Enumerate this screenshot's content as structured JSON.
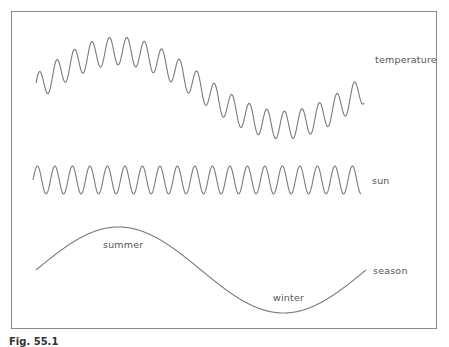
{
  "figure": {
    "caption": "Fig. 55.1",
    "stroke_color": "#7a7a7a",
    "frame_color": "#8a8a8a"
  },
  "curves": [
    {
      "id": "temperature",
      "label": "temperature",
      "x_start": 36,
      "x_end": 364,
      "center_y": 88,
      "slow_amplitude": 37,
      "fast_amplitude": 14,
      "fast_period": 17.5,
      "slow_period": 330
    },
    {
      "id": "sun",
      "label": "sun",
      "x_start": 33,
      "x_end": 361,
      "center_y": 180,
      "amplitude": 14,
      "period": 17.5
    },
    {
      "id": "season",
      "label": "season",
      "x_start": 36,
      "x_end": 366,
      "center_y": 270,
      "amplitude": 43,
      "period": 330
    }
  ],
  "annotations": {
    "summer": "summer",
    "winter": "winter"
  },
  "labels": {
    "temperature": "temperature",
    "sun": "sun",
    "season": "season"
  }
}
